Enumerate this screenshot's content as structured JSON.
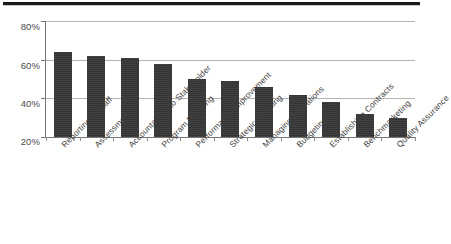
{
  "figure": {
    "has_top_rule": true,
    "background_color": "#ffffff",
    "bar_color": "#383838",
    "gridline_color": "#b4b4b4",
    "axis_color": "#767676"
  },
  "chart_data": {
    "type": "bar",
    "title": "",
    "subtitle": "",
    "xlabel": "",
    "ylabel": "",
    "ylim": [
      20,
      80
    ],
    "yticks": [
      20,
      40,
      60,
      80
    ],
    "ytick_labels": [
      "20%",
      "40%",
      "60%",
      "80%"
    ],
    "grid": true,
    "legend": false,
    "legend_position": "none",
    "value_format": "percent",
    "categories": [
      "Reporting to Staff",
      "Assessment",
      "Accountability to Stakeholder",
      "Program Planning",
      "Performance Improvement",
      "Strategic Planning",
      "Managing Operations",
      "Budgeting",
      "Establishing Contracts",
      "Benchmarketing",
      "Quality Assurance"
    ],
    "values": [
      64,
      62,
      61,
      58,
      50,
      49,
      46,
      42,
      38,
      32,
      30
    ],
    "annotations": []
  }
}
